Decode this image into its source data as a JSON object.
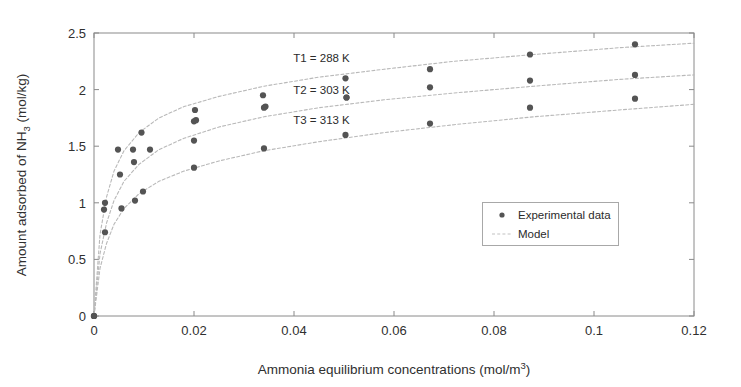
{
  "chart_data": {
    "type": "scatter",
    "title": "",
    "xlabel": "Ammonia equilibrium concentrations (mol/m3)",
    "xlabel_main": "Ammonia equilibrium concentrations (mol/m",
    "xlabel_sup": "3",
    "xlabel_tail": ")",
    "ylabel_part1": "Amount adsorbed of NH",
    "ylabel_sub": "3",
    "ylabel_part2": " (mol/kg)",
    "ylabel": "Amount adsorbed of NH3 (mol/kg)",
    "xlim": [
      0,
      0.12
    ],
    "ylim": [
      0,
      2.5
    ],
    "xticks": [
      0,
      0.02,
      0.04,
      0.06,
      0.08,
      0.1,
      0.12
    ],
    "xtick_labels": [
      "0",
      "0.02",
      "0.04",
      "0.06",
      "0.08",
      "0.1",
      "0.12"
    ],
    "yticks": [
      0,
      0.5,
      1,
      1.5,
      2,
      2.5
    ],
    "ytick_labels": [
      "0",
      "0.5",
      "1",
      "1.5",
      "2",
      "2.5"
    ],
    "grid": false,
    "legend_position": "center-right",
    "marker_color": "#545454",
    "model_color": "#b9b9b9",
    "axis_color": "#8a8a8a",
    "series": [
      {
        "name": "T1 = 288 K",
        "temperature_K": 288,
        "annotation": "T1 = 288 K",
        "experimental": [
          {
            "x": 0.0,
            "y": 0.0
          },
          {
            "x": 0.0022,
            "y": 1.0
          },
          {
            "x": 0.0048,
            "y": 1.47
          },
          {
            "x": 0.0078,
            "y": 1.47
          },
          {
            "x": 0.0095,
            "y": 1.62
          },
          {
            "x": 0.0202,
            "y": 1.82
          },
          {
            "x": 0.0204,
            "y": 1.73
          },
          {
            "x": 0.0338,
            "y": 1.95
          },
          {
            "x": 0.0343,
            "y": 1.85
          },
          {
            "x": 0.0503,
            "y": 2.1
          },
          {
            "x": 0.0505,
            "y": 1.93
          },
          {
            "x": 0.0672,
            "y": 2.18
          },
          {
            "x": 0.0872,
            "y": 2.31
          },
          {
            "x": 0.1082,
            "y": 2.4
          }
        ],
        "model": [
          {
            "x": 0.0,
            "y": 0.0
          },
          {
            "x": 0.0012,
            "y": 0.72
          },
          {
            "x": 0.0025,
            "y": 1.05
          },
          {
            "x": 0.004,
            "y": 1.28
          },
          {
            "x": 0.006,
            "y": 1.46
          },
          {
            "x": 0.009,
            "y": 1.62
          },
          {
            "x": 0.013,
            "y": 1.75
          },
          {
            "x": 0.018,
            "y": 1.85
          },
          {
            "x": 0.025,
            "y": 1.94
          },
          {
            "x": 0.034,
            "y": 2.03
          },
          {
            "x": 0.045,
            "y": 2.11
          },
          {
            "x": 0.058,
            "y": 2.18
          },
          {
            "x": 0.072,
            "y": 2.25
          },
          {
            "x": 0.088,
            "y": 2.31
          },
          {
            "x": 0.105,
            "y": 2.37
          },
          {
            "x": 0.12,
            "y": 2.41
          }
        ]
      },
      {
        "name": "T2 = 303 K",
        "temperature_K": 303,
        "annotation": "T2 = 303 K",
        "experimental": [
          {
            "x": 0.0,
            "y": 0.0
          },
          {
            "x": 0.002,
            "y": 0.94
          },
          {
            "x": 0.0052,
            "y": 1.25
          },
          {
            "x": 0.008,
            "y": 1.36
          },
          {
            "x": 0.0112,
            "y": 1.47
          },
          {
            "x": 0.02,
            "y": 1.55
          },
          {
            "x": 0.02,
            "y": 1.72
          },
          {
            "x": 0.034,
            "y": 1.84
          },
          {
            "x": 0.0505,
            "y": 1.93
          },
          {
            "x": 0.0672,
            "y": 2.02
          },
          {
            "x": 0.0872,
            "y": 2.08
          },
          {
            "x": 0.1082,
            "y": 2.13
          }
        ],
        "model": [
          {
            "x": 0.0,
            "y": 0.0
          },
          {
            "x": 0.0012,
            "y": 0.55
          },
          {
            "x": 0.0025,
            "y": 0.82
          },
          {
            "x": 0.004,
            "y": 1.02
          },
          {
            "x": 0.006,
            "y": 1.19
          },
          {
            "x": 0.009,
            "y": 1.34
          },
          {
            "x": 0.013,
            "y": 1.47
          },
          {
            "x": 0.018,
            "y": 1.57
          },
          {
            "x": 0.025,
            "y": 1.67
          },
          {
            "x": 0.034,
            "y": 1.76
          },
          {
            "x": 0.045,
            "y": 1.84
          },
          {
            "x": 0.058,
            "y": 1.91
          },
          {
            "x": 0.072,
            "y": 1.97
          },
          {
            "x": 0.088,
            "y": 2.03
          },
          {
            "x": 0.105,
            "y": 2.09
          },
          {
            "x": 0.12,
            "y": 2.13
          }
        ]
      },
      {
        "name": "T3 = 313 K",
        "temperature_K": 313,
        "annotation": "T3 = 313 K",
        "experimental": [
          {
            "x": 0.0,
            "y": 0.0
          },
          {
            "x": 0.0022,
            "y": 0.74
          },
          {
            "x": 0.0055,
            "y": 0.95
          },
          {
            "x": 0.0082,
            "y": 1.02
          },
          {
            "x": 0.0098,
            "y": 1.1
          },
          {
            "x": 0.02,
            "y": 1.31
          },
          {
            "x": 0.034,
            "y": 1.48
          },
          {
            "x": 0.0503,
            "y": 1.6
          },
          {
            "x": 0.0672,
            "y": 1.7
          },
          {
            "x": 0.0872,
            "y": 1.84
          },
          {
            "x": 0.1082,
            "y": 1.92
          }
        ],
        "model": [
          {
            "x": 0.0,
            "y": 0.0
          },
          {
            "x": 0.0012,
            "y": 0.42
          },
          {
            "x": 0.0025,
            "y": 0.64
          },
          {
            "x": 0.004,
            "y": 0.81
          },
          {
            "x": 0.006,
            "y": 0.95
          },
          {
            "x": 0.009,
            "y": 1.08
          },
          {
            "x": 0.013,
            "y": 1.19
          },
          {
            "x": 0.018,
            "y": 1.28
          },
          {
            "x": 0.025,
            "y": 1.37
          },
          {
            "x": 0.034,
            "y": 1.46
          },
          {
            "x": 0.045,
            "y": 1.54
          },
          {
            "x": 0.058,
            "y": 1.62
          },
          {
            "x": 0.072,
            "y": 1.69
          },
          {
            "x": 0.088,
            "y": 1.76
          },
          {
            "x": 0.105,
            "y": 1.82
          },
          {
            "x": 0.12,
            "y": 1.87
          }
        ]
      }
    ],
    "annotations": [
      {
        "text": "T1 = 288 K",
        "x": 0.0455,
        "y": 2.245
      },
      {
        "text": "T2 = 303 K",
        "x": 0.0455,
        "y": 1.965
      },
      {
        "text": "T3 = 313 K",
        "x": 0.0455,
        "y": 1.7
      }
    ],
    "legend": {
      "entries": [
        {
          "label": "Experimental data",
          "marker": "dot"
        },
        {
          "label": "Model",
          "marker": "line"
        }
      ]
    }
  }
}
